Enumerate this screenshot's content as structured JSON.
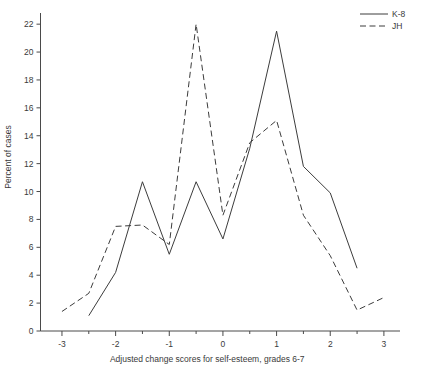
{
  "chart_data": {
    "type": "line",
    "title": "",
    "xlabel": "Adjusted change scores for self-esteem, grades 6-7",
    "ylabel": "Percent of cases",
    "xlim": [
      -3.4,
      3.3
    ],
    "ylim": [
      0,
      22.8
    ],
    "xticks": [
      -3,
      -2,
      -1,
      0,
      1,
      2,
      3
    ],
    "xticklabels": [
      "-3",
      "-2",
      "-1",
      "0",
      "1",
      "2",
      "3"
    ],
    "xminorticks": [
      -2.5,
      -1.5,
      -0.5,
      0.5,
      1.5,
      2.5
    ],
    "yticks": [
      0,
      2,
      4,
      6,
      8,
      10,
      12,
      14,
      16,
      18,
      20,
      22
    ],
    "yticklabels": [
      "0",
      "2",
      "4",
      "6",
      "8",
      "10",
      "12",
      "14",
      "16",
      "18",
      "20",
      "22"
    ],
    "grid": false,
    "legend_position": "top-right",
    "series": [
      {
        "name": "K-8",
        "style": "solid",
        "color": "#3c3c3c",
        "x": [
          -2.5,
          -2,
          -1.5,
          -1,
          -0.5,
          0,
          0.5,
          1,
          1.5,
          2,
          2.5
        ],
        "values": [
          1.1,
          4.2,
          10.7,
          5.5,
          10.7,
          6.6,
          13.1,
          21.5,
          11.8,
          9.9,
          4.5
        ]
      },
      {
        "name": "JH",
        "style": "dashed",
        "color": "#3c3c3c",
        "x": [
          -3,
          -2.5,
          -2,
          -1.5,
          -1,
          -0.5,
          0,
          0.5,
          1,
          1.5,
          2,
          2.5,
          3
        ],
        "values": [
          1.4,
          2.7,
          7.5,
          7.6,
          6.2,
          22.0,
          8.3,
          13.5,
          15.1,
          8.3,
          5.4,
          1.5,
          2.4
        ]
      }
    ]
  },
  "legend": {
    "entries": [
      {
        "label": "K-8",
        "style": "solid"
      },
      {
        "label": "JH",
        "style": "dashed"
      }
    ]
  },
  "axes": {
    "x_title": "Adjusted change scores for self-esteem, grades 6-7",
    "y_title": "Percent of cases"
  }
}
